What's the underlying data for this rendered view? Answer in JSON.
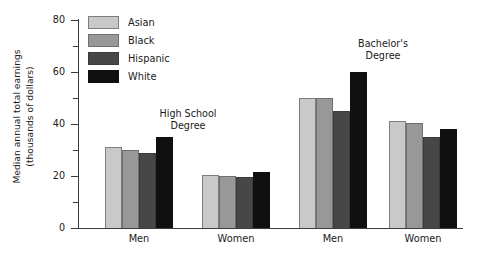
{
  "chart_data": {
    "type": "bar",
    "title": "",
    "xlabel": "",
    "ylabel_line1": "Median annual total earnings",
    "ylabel_line2": "(thousands of dollars)",
    "ylim": [
      0,
      80
    ],
    "yticks": [
      0,
      20,
      40,
      60,
      80
    ],
    "ytick_labels": [
      "0",
      "20",
      "40",
      "60",
      "80"
    ],
    "yminor_ticks": [
      10,
      30,
      50,
      70
    ],
    "grid": false,
    "legend_position": "upper-left-inside",
    "categories": [
      "Men",
      "Women",
      "Men",
      "Women"
    ],
    "group_annotations": [
      {
        "line1": "High School",
        "line2": "Degree",
        "applies_to": [
          "Men",
          "Women"
        ]
      },
      {
        "line1": "Bachelor's",
        "line2": "Degree",
        "applies_to": [
          "Men",
          "Women"
        ]
      }
    ],
    "series": [
      {
        "name": "Asian",
        "color": "#c9c9c9",
        "values": [
          31,
          20.5,
          50,
          41
        ]
      },
      {
        "name": "Black",
        "color": "#989898",
        "values": [
          30,
          20,
          50,
          40.5
        ]
      },
      {
        "name": "Hispanic",
        "color": "#474747",
        "values": [
          29,
          19.5,
          45,
          35
        ]
      },
      {
        "name": "White",
        "color": "#101010",
        "values": [
          35,
          21.5,
          60,
          38
        ]
      }
    ]
  },
  "legend": {
    "items": [
      {
        "label": "Asian",
        "swatch_class": "c-asian"
      },
      {
        "label": "Black",
        "swatch_class": "c-black"
      },
      {
        "label": "Hispanic",
        "swatch_class": "c-hispanic"
      },
      {
        "label": "White",
        "swatch_class": "c-white"
      }
    ]
  },
  "axes": {
    "y_label_line1": "Median annual total earnings",
    "y_label_line2": "(thousands of dollars)"
  }
}
